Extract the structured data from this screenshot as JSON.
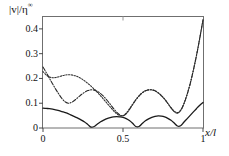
{
  "chart_data": {
    "type": "line",
    "title": "",
    "subtitle": "",
    "xlabel": "x/l",
    "ylabel": "|v|/η∞",
    "ylabel_parts": {
      "numerator": "|v|",
      "slash": "/",
      "denominator": "η",
      "exponent": "∞"
    },
    "xlim": [
      0,
      1
    ],
    "ylim": [
      0,
      0.45
    ],
    "xticks": [
      0,
      0.5,
      1
    ],
    "xticklabels": [
      "0",
      "0.5",
      "1"
    ],
    "yticks": [
      0,
      0.1,
      0.2,
      0.3,
      0.4
    ],
    "yticklabels": [
      "0",
      "0.1",
      "0.2",
      "0.3",
      "0.4"
    ],
    "grid": false,
    "legend": "none",
    "box": true,
    "series": [
      {
        "name": "solid",
        "style": "solid",
        "color": "#1a1a1a",
        "x": [
          0.0,
          0.02,
          0.04,
          0.06,
          0.08,
          0.1,
          0.12,
          0.14,
          0.16,
          0.18,
          0.2,
          0.22,
          0.24,
          0.26,
          0.28,
          0.3,
          0.32,
          0.34,
          0.36,
          0.38,
          0.4,
          0.42,
          0.44,
          0.46,
          0.48,
          0.5,
          0.52,
          0.54,
          0.56,
          0.58,
          0.6,
          0.62,
          0.64,
          0.66,
          0.68,
          0.7,
          0.72,
          0.74,
          0.76,
          0.78,
          0.8,
          0.82,
          0.84,
          0.86,
          0.88,
          0.9,
          0.92,
          0.94,
          0.96,
          0.98,
          1.0
        ],
        "y": [
          0.08,
          0.079,
          0.078,
          0.076,
          0.073,
          0.07,
          0.066,
          0.062,
          0.057,
          0.051,
          0.045,
          0.039,
          0.032,
          0.024,
          0.014,
          0.004,
          0.006,
          0.016,
          0.025,
          0.032,
          0.038,
          0.042,
          0.045,
          0.046,
          0.045,
          0.043,
          0.038,
          0.03,
          0.019,
          0.006,
          0.006,
          0.018,
          0.029,
          0.037,
          0.043,
          0.047,
          0.049,
          0.048,
          0.045,
          0.039,
          0.031,
          0.02,
          0.008,
          0.009,
          0.023,
          0.037,
          0.051,
          0.065,
          0.079,
          0.092,
          0.103
        ]
      },
      {
        "name": "dotted",
        "style": "dotted",
        "color": "#333333",
        "x": [
          0.0,
          0.02,
          0.04,
          0.06,
          0.08,
          0.1,
          0.12,
          0.14,
          0.16,
          0.18,
          0.2,
          0.22,
          0.24,
          0.26,
          0.28,
          0.3,
          0.32,
          0.34,
          0.36,
          0.38,
          0.4,
          0.42,
          0.44,
          0.46,
          0.48,
          0.5,
          0.52,
          0.54,
          0.56,
          0.58,
          0.6,
          0.62,
          0.64,
          0.66,
          0.68,
          0.7,
          0.72,
          0.74,
          0.76,
          0.78,
          0.8,
          0.82,
          0.84,
          0.86,
          0.88,
          0.9,
          0.92,
          0.94,
          0.96,
          0.98,
          1.0
        ],
        "y": [
          0.228,
          0.214,
          0.206,
          0.203,
          0.204,
          0.207,
          0.211,
          0.214,
          0.215,
          0.214,
          0.211,
          0.206,
          0.199,
          0.19,
          0.18,
          0.169,
          0.157,
          0.144,
          0.13,
          0.115,
          0.1,
          0.085,
          0.07,
          0.058,
          0.05,
          0.05,
          0.06,
          0.077,
          0.096,
          0.114,
          0.13,
          0.142,
          0.15,
          0.154,
          0.154,
          0.15,
          0.142,
          0.131,
          0.117,
          0.1,
          0.082,
          0.068,
          0.062,
          0.072,
          0.098,
          0.135,
          0.18,
          0.235,
          0.296,
          0.365,
          0.438
        ]
      },
      {
        "name": "dash-dot",
        "style": "dashdot",
        "color": "#2b2b2b",
        "x": [
          0.0,
          0.02,
          0.04,
          0.06,
          0.08,
          0.1,
          0.12,
          0.14,
          0.16,
          0.18,
          0.2,
          0.22,
          0.24,
          0.26,
          0.28,
          0.3,
          0.32,
          0.34,
          0.36,
          0.38,
          0.4,
          0.42,
          0.44,
          0.46,
          0.48,
          0.5,
          0.52,
          0.54,
          0.56,
          0.58,
          0.6,
          0.62,
          0.64,
          0.66,
          0.68,
          0.7,
          0.72,
          0.74,
          0.76,
          0.78,
          0.8,
          0.82,
          0.84,
          0.86,
          0.88,
          0.9,
          0.92,
          0.94,
          0.96,
          0.98,
          1.0
        ],
        "y": [
          0.246,
          0.224,
          0.201,
          0.178,
          0.156,
          0.136,
          0.118,
          0.105,
          0.1,
          0.104,
          0.113,
          0.124,
          0.135,
          0.144,
          0.151,
          0.154,
          0.153,
          0.148,
          0.139,
          0.127,
          0.112,
          0.096,
          0.079,
          0.064,
          0.053,
          0.049,
          0.057,
          0.074,
          0.094,
          0.113,
          0.129,
          0.142,
          0.15,
          0.154,
          0.154,
          0.15,
          0.142,
          0.13,
          0.116,
          0.099,
          0.081,
          0.066,
          0.06,
          0.07,
          0.096,
          0.133,
          0.178,
          0.233,
          0.294,
          0.362,
          0.435
        ]
      }
    ]
  },
  "axes": {
    "ylabel_display": "|v|/η",
    "ylabel_exponent": "∞",
    "xlabel_display": "x/l"
  }
}
